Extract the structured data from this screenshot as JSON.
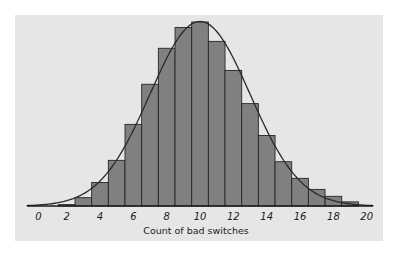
{
  "chart_data": {
    "type": "bar",
    "subtype": "histogram_with_density_curve",
    "title": "",
    "xlabel": "Count of bad switches",
    "ylabel": "",
    "categories": [
      0,
      1,
      2,
      3,
      4,
      5,
      6,
      7,
      8,
      9,
      10,
      11,
      12,
      13,
      14,
      15,
      16,
      17,
      18,
      19,
      20
    ],
    "values": [
      0.0,
      0.0,
      0.001,
      0.006,
      0.017,
      0.033,
      0.059,
      0.088,
      0.114,
      0.129,
      0.133,
      0.119,
      0.098,
      0.074,
      0.051,
      0.032,
      0.02,
      0.012,
      0.007,
      0.003,
      0.0
    ],
    "curve": {
      "type": "normal",
      "mean": 10,
      "sd": 3
    },
    "xticks": [
      0,
      2,
      4,
      6,
      8,
      10,
      12,
      14,
      16,
      18,
      20
    ],
    "xlim": [
      -0.5,
      20.5
    ],
    "ylim": [
      0,
      0.14
    ],
    "grid": false,
    "legend": null
  },
  "colors": {
    "panel": "#e6e6e6",
    "bar_fill": "#808080",
    "bar_stroke": "#262626",
    "curve": "#2a2a2a",
    "axis": "#1a1a1a"
  }
}
